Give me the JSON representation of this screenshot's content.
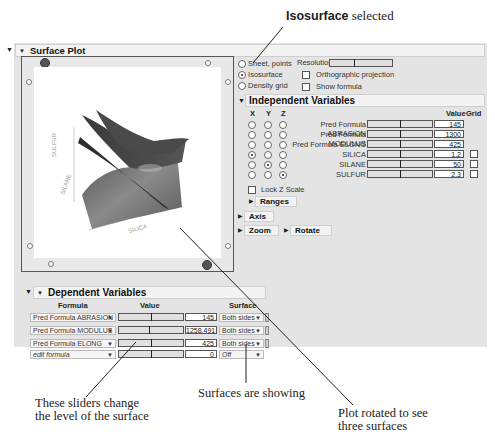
{
  "callouts": {
    "top_bold": "Isosurface",
    "top_rest": " selected",
    "sliders": [
      "These sliders change",
      "the level of the surface"
    ],
    "surfaces": "Surfaces are showing",
    "rotated": [
      "Plot rotated to see",
      "three surfaces"
    ]
  },
  "surface_plot": {
    "title": "Surface Plot",
    "axis_labels": {
      "x": "SILICA",
      "y": "SILANE",
      "z": "SULFUR"
    },
    "mode_options": [
      {
        "label": "Sheet, points",
        "selected": false
      },
      {
        "label": "Isosurface",
        "selected": true
      },
      {
        "label": "Density grid",
        "selected": false
      }
    ],
    "resolution_label": "Resolution",
    "orthographic_label": "Orthographic projection",
    "show_formula_label": "Show formula"
  },
  "independent_variables": {
    "title": "Independent Variables",
    "headers": {
      "x": "X",
      "y": "Y",
      "z": "Z",
      "value": "Value",
      "grid": "Grid"
    },
    "rows": [
      {
        "name": "Pred Formula ABRASION",
        "axis": "",
        "value": "145",
        "grid": false
      },
      {
        "name": "Pred Formula MODULUS",
        "axis": "",
        "value": "1300",
        "grid": false
      },
      {
        "name": "Pred Formula ELONG",
        "axis": "",
        "value": "425",
        "grid": false
      },
      {
        "name": "SILICA",
        "axis": "x",
        "value": "1.2",
        "grid": true
      },
      {
        "name": "SILANE",
        "axis": "y",
        "value": "50",
        "grid": true
      },
      {
        "name": "SULFUR",
        "axis": "z",
        "value": "2.3",
        "grid": true
      }
    ],
    "lock_z_label": "Lock Z Scale",
    "ranges_label": "Ranges",
    "axis_label": "Axis",
    "zoom_label": "Zoom",
    "rotate_label": "Rotate"
  },
  "dependent_variables": {
    "title": "Dependent Variables",
    "headers": {
      "formula": "Formula",
      "value": "Value",
      "surface": "Surface"
    },
    "rows": [
      {
        "formula": "Pred Formula ABRASION",
        "value": "145",
        "surface": "Both sides",
        "italic": false
      },
      {
        "formula": "Pred Formula MODULUS",
        "value": "1258.491",
        "surface": "Both sides",
        "italic": false
      },
      {
        "formula": "Pred Formula ELONG",
        "value": "425",
        "surface": "Both sides",
        "italic": false
      },
      {
        "formula": "edit formula",
        "value": "0",
        "surface": "Off",
        "italic": true
      }
    ]
  }
}
